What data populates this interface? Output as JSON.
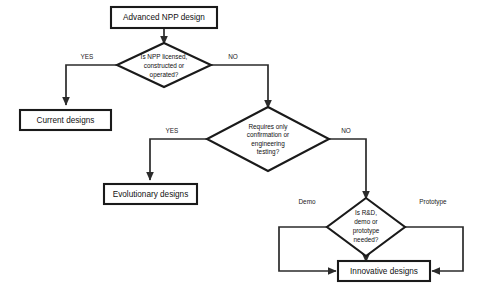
{
  "diagram": {
    "type": "flowchart",
    "background_color": "#ffffff",
    "line_color": "#2b2b2b",
    "node_stroke_color": "#1a1a1a",
    "nodes": [
      {
        "id": "start",
        "shape": "box",
        "label": "Advanced NPP design"
      },
      {
        "id": "decision1",
        "shape": "diamond",
        "label_line1": "Is NPP licensed,",
        "label_line2": "constructed or",
        "label_line3": "operated?"
      },
      {
        "id": "current",
        "shape": "box",
        "label": "Current designs"
      },
      {
        "id": "decision2",
        "shape": "diamond",
        "label_line1": "Requires only",
        "label_line2": "confirmation or",
        "label_line3": "engineering",
        "label_line4": "testing?"
      },
      {
        "id": "evolutionary",
        "shape": "box",
        "label": "Evolutionary designs"
      },
      {
        "id": "decision3",
        "shape": "diamond",
        "label_line1": "Is R&D,",
        "label_line2": "demo or",
        "label_line3": "prototype",
        "label_line4": "needed?"
      },
      {
        "id": "innovative",
        "shape": "box",
        "label": "Innovative designs"
      }
    ],
    "edge_labels": {
      "d1_yes": "YES",
      "d1_no": "NO",
      "d2_yes": "YES",
      "d2_no": "NO",
      "d3_left": "Demo",
      "d3_right": "Prototype"
    }
  }
}
